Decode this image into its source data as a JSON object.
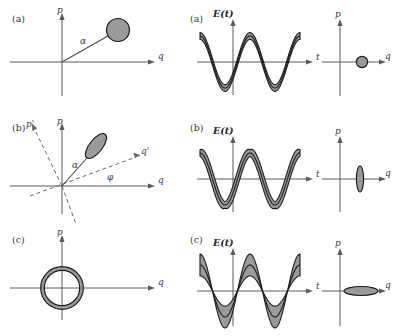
{
  "figure": {
    "colors": {
      "blob_fill": "#9a9a9a",
      "outline": "#1c1c1c",
      "axis": "#5a5a5a",
      "background": "#ffffff",
      "text": "#3a3a3a"
    },
    "rows": [
      {
        "id": "row-a",
        "label": "(a)",
        "state": "coherent state",
        "left": {
          "panel_label": "(a)",
          "x_axis_label": "q",
          "y_axis_label": "p",
          "vector_label": "α",
          "shape": "circle",
          "shape_center": {
            "q": 0.72,
            "p": 0.62
          },
          "shape_size": {
            "major": 0.2,
            "minor": 0.2
          },
          "shape_rotation_deg": 0,
          "rotated_axes": false
        },
        "right_wave": {
          "panel_label": "(a)",
          "y_axis_label": "E(t)",
          "x_axis_label": "t",
          "squeezing": "none",
          "band_profile": "uniform",
          "band_width": 0.13,
          "amplitude": 1.0,
          "cycles": 2,
          "phase_deg": 90
        },
        "right_phasor": {
          "x_axis_label": "q",
          "y_axis_label": "p",
          "shape": "circle",
          "shape_center": {
            "q": 0.62,
            "p": 0.0
          },
          "shape_size": {
            "major": 0.13,
            "minor": 0.13
          },
          "shape_rotation_deg": 0
        }
      },
      {
        "id": "row-b",
        "label": "(b)",
        "state": "phase-squeezed state",
        "left": {
          "panel_label": "(b)",
          "x_axis_label": "q",
          "y_axis_label": "p",
          "x_axis_rotated_label": "q'",
          "y_axis_rotated_label": "p'",
          "vector_label": "α",
          "angle_label": "φ",
          "rotation_angle_deg": 22,
          "shape": "ellipse",
          "shape_center": {
            "q": 0.4,
            "p": 0.72
          },
          "shape_size": {
            "major": 0.34,
            "minor": 0.15
          },
          "shape_rotation_deg": -38,
          "rotated_axes": true
        },
        "right_wave": {
          "panel_label": "(b)",
          "y_axis_label": "E(t)",
          "x_axis_label": "t",
          "squeezing": "phase",
          "band_profile": "wide at extrema, narrow at zero crossings",
          "band_width": 0.3,
          "amplitude": 1.0,
          "cycles": 2,
          "phase_deg": 90
        },
        "right_phasor": {
          "x_axis_label": "q",
          "y_axis_label": "p",
          "shape": "ellipse",
          "shape_center": {
            "q": 0.55,
            "p": 0.0
          },
          "shape_size": {
            "major": 0.3,
            "minor": 0.075
          },
          "shape_rotation_deg": 90
        }
      },
      {
        "id": "row-c",
        "label": "(c)",
        "state": "amplitude-squeezed / number state ring",
        "left": {
          "panel_label": "(c)",
          "x_axis_label": "q",
          "y_axis_label": "p",
          "shape": "annulus",
          "shape_center": {
            "q": 0.0,
            "p": 0.0
          },
          "shape_size": {
            "radius": 0.42,
            "thickness": 0.085
          },
          "rotated_axes": false
        },
        "right_wave": {
          "panel_label": "(c)",
          "y_axis_label": "E(t)",
          "x_axis_label": "t",
          "squeezing": "amplitude",
          "band_profile": "narrow at zero crossings, wide at extrema",
          "band_width": 0.42,
          "amplitude": 1.0,
          "cycles": 2,
          "phase_deg": 90
        },
        "right_phasor": {
          "x_axis_label": "q",
          "y_axis_label": "p",
          "shape": "ellipse",
          "shape_center": {
            "q": 0.55,
            "p": 0.0
          },
          "shape_size": {
            "major": 0.4,
            "minor": 0.1
          },
          "shape_rotation_deg": 0
        }
      }
    ]
  }
}
